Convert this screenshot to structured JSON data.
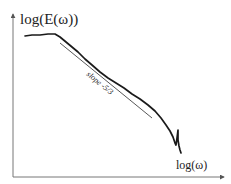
{
  "chart_data": {
    "type": "line",
    "title": "",
    "xlabel": "log(ω)",
    "ylabel": "log(E(ω))",
    "grid": false,
    "legend": null,
    "axes": {
      "x_ticks": [],
      "y_ticks": [],
      "arrows": true
    },
    "series": [
      {
        "name": "energy spectrum",
        "color": "#1a1a1a",
        "points_px": [
          [
            25,
            36
          ],
          [
            32,
            35
          ],
          [
            40,
            35
          ],
          [
            48,
            34
          ],
          [
            55,
            34
          ],
          [
            60,
            37
          ],
          [
            66,
            42
          ],
          [
            72,
            47
          ],
          [
            78,
            52
          ],
          [
            85,
            59
          ],
          [
            92,
            65
          ],
          [
            100,
            72
          ],
          [
            108,
            78
          ],
          [
            116,
            83
          ],
          [
            124,
            88
          ],
          [
            132,
            94
          ],
          [
            140,
            99
          ],
          [
            148,
            105
          ],
          [
            155,
            111
          ],
          [
            161,
            118
          ],
          [
            166,
            125
          ],
          [
            170,
            131
          ],
          [
            173,
            137
          ],
          [
            175,
            143
          ],
          [
            176,
            145
          ],
          [
            177,
            138
          ],
          [
            178,
            130
          ],
          [
            178,
            140
          ],
          [
            179,
            146
          ],
          [
            180,
            150
          ],
          [
            181,
            153
          ]
        ]
      }
    ],
    "annotations": [
      {
        "type": "reference_line",
        "label": "slope -5/3",
        "slope": -1.6667,
        "from_px": [
          60,
          43
        ],
        "to_px": [
          152,
          118
        ],
        "color": "#444444"
      }
    ]
  },
  "labels": {
    "y_axis": "log(E(ω))",
    "x_axis": "log(ω)",
    "slope": "slope -5/3"
  }
}
